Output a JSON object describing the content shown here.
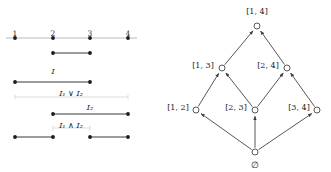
{
  "figure": {
    "left_panel": {
      "name": "interval-number-line-diagram",
      "axis": {
        "tick_labels": [
          "1",
          "2",
          "3",
          "4"
        ],
        "tick_positions": [
          15,
          53,
          90,
          128
        ],
        "axis_y": 38,
        "label_y": 30,
        "axis_color": "#a8a8a8",
        "dot_color": "#1a1a1a"
      },
      "rows": [
        {
          "id": "row-interval-2-3",
          "label": "",
          "label_y": 0,
          "segment_y": 53,
          "spans": [
            [
              53,
              90
            ]
          ],
          "style": "solid"
        },
        {
          "id": "row-I1",
          "label": "I₁",
          "label_text": "I",
          "label_sub": "1",
          "label_x": 53,
          "label_y": 68,
          "segment_y": 82,
          "spans": [
            [
              15,
              90
            ]
          ],
          "style": "solid"
        },
        {
          "id": "row-I1-join-I2",
          "label_text": "I₁ ∨ I₂",
          "label_x": 71,
          "label_y": 90,
          "segment_y": 97,
          "spans": [
            [
              15,
              128
            ]
          ],
          "style": "faint"
        },
        {
          "id": "row-I2",
          "label_text": "I₂",
          "label_x": 90,
          "label_y": 104,
          "segment_y": 114,
          "spans": [
            [
              53,
              128
            ]
          ],
          "style": "solid"
        },
        {
          "id": "row-I1-meet-I2",
          "label_text": "I₁ ∧ I₂",
          "label_x": 71,
          "label_y": 122,
          "segment_y": 128,
          "spans": [
            [
              53,
              90
            ]
          ],
          "style": "faint"
        },
        {
          "id": "row-bottom-pair",
          "label_text": "",
          "segment_y": 137,
          "spans": [
            [
              15,
              53
            ],
            [
              90,
              128
            ]
          ],
          "style": "solid"
        }
      ],
      "labels": {
        "I1": "I₁",
        "I1_join_I2": "I₁ ∨ I₂",
        "I2": "I₂",
        "I1_meet_I2": "I₁ ∧ I₂"
      }
    },
    "right_panel": {
      "name": "interval-lattice-hasse-diagram",
      "nodes": [
        {
          "id": "top",
          "label": "[1, 4]",
          "x": 257,
          "y": 26,
          "label_x": 257,
          "label_y": 12,
          "label_pos": "above"
        },
        {
          "id": "n13",
          "label": "[1, 3]",
          "x": 222,
          "y": 68,
          "label_x": 203,
          "label_y": 66,
          "label_pos": "left"
        },
        {
          "id": "n24",
          "label": "[2, 4]",
          "x": 287,
          "y": 68,
          "label_x": 268,
          "label_y": 66,
          "label_pos": "left"
        },
        {
          "id": "n12",
          "label": "[1, 2]",
          "x": 196,
          "y": 110,
          "label_x": 178,
          "label_y": 108,
          "label_pos": "left"
        },
        {
          "id": "n23",
          "label": "[2, 3]",
          "x": 255,
          "y": 110,
          "label_x": 236,
          "label_y": 108,
          "label_pos": "left"
        },
        {
          "id": "n34",
          "label": "[3, 4]",
          "x": 317,
          "y": 110,
          "label_x": 299,
          "label_y": 108,
          "label_pos": "left"
        },
        {
          "id": "bottom",
          "label": "∅",
          "x": 255,
          "y": 152,
          "label_x": 255,
          "label_y": 165,
          "label_pos": "below"
        }
      ],
      "edges": [
        {
          "from": "n13",
          "to": "top"
        },
        {
          "from": "n24",
          "to": "top"
        },
        {
          "from": "n12",
          "to": "n13"
        },
        {
          "from": "n23",
          "to": "n13"
        },
        {
          "from": "n23",
          "to": "n24"
        },
        {
          "from": "n34",
          "to": "n24"
        },
        {
          "from": "bottom",
          "to": "n12"
        },
        {
          "from": "bottom",
          "to": "n23"
        },
        {
          "from": "bottom",
          "to": "n34"
        }
      ],
      "node_radius": 3,
      "edge_color": "#3a3a3a",
      "node_stroke": "#3a3a3a",
      "node_fill": "#ffffff"
    },
    "colors": {
      "ink": "#1a1a1a",
      "axis_gray": "#a8a8a8",
      "faint_gray": "#d0d0d0",
      "segment": "#3a3a3a"
    }
  }
}
